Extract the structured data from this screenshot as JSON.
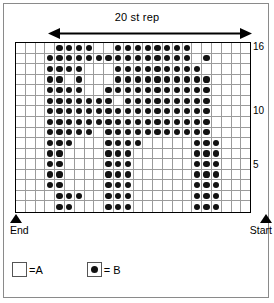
{
  "header": {
    "repeat_label": "20 st rep"
  },
  "markers": {
    "end_label": "End",
    "start_label": "Start"
  },
  "legend": {
    "items": [
      {
        "symbol": "empty-square",
        "text": "=A",
        "color": "#ffffff"
      },
      {
        "symbol": "filled-dot-square",
        "text": "= B",
        "color": "#111111"
      }
    ]
  },
  "chart_data": {
    "type": "heatmap",
    "title": "20 st rep",
    "xlabel": "",
    "ylabel": "",
    "columns": 24,
    "rows": 16,
    "row_tick_labels": [
      "16",
      "10",
      "5"
    ],
    "row_tick_rows": [
      16,
      10,
      5
    ],
    "legend_position": "bottom-left",
    "grid": true,
    "color_key": {
      "A": "#ffffff",
      "B": "#111111"
    },
    "row_numbers_top_to_bottom": [
      16,
      15,
      14,
      13,
      12,
      11,
      10,
      9,
      8,
      7,
      6,
      5,
      4,
      3,
      2,
      1
    ],
    "cells": [
      "000011110011111111000000",
      "000111111111111111010000",
      "000111100011111111100000",
      "000110100011111111110000",
      "000111100111111111110000",
      "000111111101111111110000",
      "000111111111111111110000",
      "000111111111111111110000",
      "000111110111111111110000",
      "000111000111100000111000",
      "000110000111000000111000",
      "000110000111000000111000",
      "000110000111000000111000",
      "000110000111000000111000",
      "000011100111000000111000",
      "000011000111000000111000"
    ]
  }
}
